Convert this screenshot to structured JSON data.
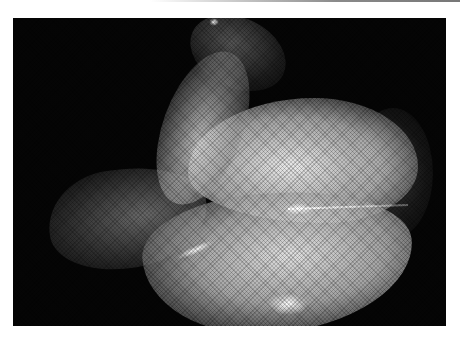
{
  "image": {
    "subject": "translucent woven mesh sculpture on black background",
    "background_color": "#050505",
    "page_color": "#ffffff",
    "alt": "Photograph of a folded translucent mesh sculpture lit against black"
  }
}
